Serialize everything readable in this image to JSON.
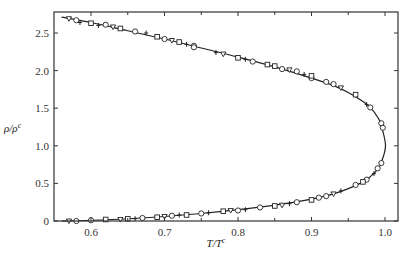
{
  "chart_data": {
    "type": "scatter",
    "title": "",
    "xlabel": "T/T^c",
    "ylabel": "ρ/ρ^c",
    "xlim": [
      0.55,
      1.02
    ],
    "ylim": [
      0,
      2.78
    ],
    "grid": false,
    "legend": null,
    "x_ticks": [
      0.6,
      0.7,
      0.8,
      0.9,
      1.0
    ],
    "x_tick_labels": [
      "0.6",
      "0.7",
      "0.8",
      "0.9",
      "1.0"
    ],
    "y_ticks": [
      0,
      0.5,
      1.0,
      1.5,
      2.0,
      2.5
    ],
    "y_tick_labels": [
      "0",
      "0.5",
      "1.0",
      "1.5",
      "2.0",
      "2.5"
    ],
    "curve": {
      "name": "coexistence curve (fit)",
      "upper_branch": {
        "T": [
          0.56,
          0.6,
          0.65,
          0.7,
          0.75,
          0.8,
          0.85,
          0.9,
          0.93,
          0.95,
          0.97,
          0.98,
          0.99,
          0.995,
          1.0
        ],
        "rho": [
          2.71,
          2.64,
          2.53,
          2.42,
          2.3,
          2.18,
          2.05,
          1.9,
          1.8,
          1.71,
          1.59,
          1.51,
          1.38,
          1.27,
          1.0
        ]
      },
      "lower_branch": {
        "T": [
          0.56,
          0.6,
          0.65,
          0.7,
          0.75,
          0.8,
          0.85,
          0.9,
          0.93,
          0.95,
          0.97,
          0.98,
          0.99,
          0.995,
          1.0
        ],
        "rho": [
          0.0,
          0.01,
          0.03,
          0.06,
          0.1,
          0.15,
          0.21,
          0.29,
          0.36,
          0.43,
          0.52,
          0.59,
          0.69,
          0.78,
          1.0
        ]
      }
    },
    "series": [
      {
        "name": "open circles",
        "marker": "circle",
        "points": [
          [
            0.58,
            2.67
          ],
          [
            0.62,
            2.61
          ],
          [
            0.66,
            2.52
          ],
          [
            0.7,
            2.42
          ],
          [
            0.74,
            2.33
          ],
          [
            0.74,
            2.31
          ],
          [
            0.82,
            2.12
          ],
          [
            0.86,
            2.02
          ],
          [
            0.88,
            1.99
          ],
          [
            0.9,
            1.9
          ],
          [
            0.92,
            1.85
          ],
          [
            0.93,
            1.82
          ],
          [
            0.98,
            1.51
          ],
          [
            0.995,
            1.3
          ],
          [
            0.997,
            1.24
          ],
          [
            0.58,
            0.0
          ],
          [
            0.6,
            0.01
          ],
          [
            0.67,
            0.04
          ],
          [
            0.71,
            0.07
          ],
          [
            0.75,
            0.1
          ],
          [
            0.8,
            0.14
          ],
          [
            0.83,
            0.18
          ],
          [
            0.88,
            0.25
          ],
          [
            0.91,
            0.31
          ],
          [
            0.92,
            0.33
          ],
          [
            0.96,
            0.48
          ],
          [
            0.975,
            0.55
          ],
          [
            0.99,
            0.7
          ],
          [
            0.995,
            0.77
          ]
        ]
      },
      {
        "name": "open squares",
        "marker": "square",
        "points": [
          [
            0.6,
            2.63
          ],
          [
            0.64,
            2.56
          ],
          [
            0.69,
            2.45
          ],
          [
            0.72,
            2.38
          ],
          [
            0.8,
            2.17
          ],
          [
            0.84,
            2.08
          ],
          [
            0.85,
            2.06
          ],
          [
            0.9,
            1.93
          ],
          [
            0.96,
            1.68
          ],
          [
            0.62,
            0.02
          ],
          [
            0.65,
            0.03
          ],
          [
            0.69,
            0.05
          ],
          [
            0.73,
            0.08
          ],
          [
            0.78,
            0.13
          ],
          [
            0.85,
            0.2
          ],
          [
            0.9,
            0.28
          ],
          [
            0.97,
            0.52
          ]
        ]
      },
      {
        "name": "triangles",
        "marker": "triangle",
        "points": [
          [
            0.57,
            2.69
          ],
          [
            0.63,
            2.58
          ],
          [
            0.71,
            2.4
          ],
          [
            0.78,
            2.22
          ],
          [
            0.87,
            2.01
          ],
          [
            0.94,
            1.77
          ],
          [
            0.57,
            0.0
          ],
          [
            0.64,
            0.02
          ],
          [
            0.7,
            0.06
          ],
          [
            0.79,
            0.14
          ],
          [
            0.86,
            0.21
          ],
          [
            0.93,
            0.36
          ]
        ]
      },
      {
        "name": "crosses",
        "marker": "cross",
        "points": [
          [
            0.585,
            2.64
          ],
          [
            0.61,
            2.6
          ],
          [
            0.675,
            2.5
          ],
          [
            0.73,
            2.35
          ],
          [
            0.77,
            2.24
          ],
          [
            0.81,
            2.15
          ],
          [
            0.89,
            1.95
          ],
          [
            0.975,
            1.55
          ],
          [
            0.66,
            0.03
          ],
          [
            0.72,
            0.08
          ],
          [
            0.76,
            0.11
          ],
          [
            0.81,
            0.15
          ],
          [
            0.87,
            0.23
          ],
          [
            0.94,
            0.4
          ],
          [
            0.985,
            0.63
          ]
        ]
      }
    ]
  },
  "axes": {
    "xlabel_main": "T/T",
    "xlabel_sup": "c",
    "ylabel_main": "ρ/ρ",
    "ylabel_sup": "c"
  }
}
